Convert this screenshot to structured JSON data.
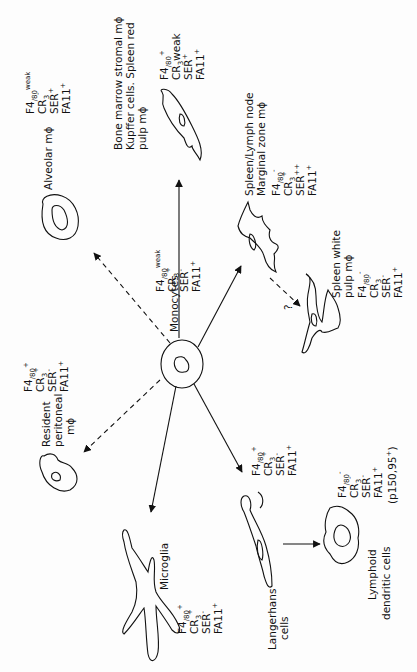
{
  "diagram": {
    "orientation": "rotated 90 degrees counter-clockwise",
    "center_node": {
      "label": "Monocytes",
      "markers": [
        {
          "name": "F4/80",
          "sign": "weak"
        },
        {
          "name": "CR3",
          "sign": "+"
        },
        {
          "name": "SER",
          "sign": "-"
        },
        {
          "name": "FA11",
          "sign": "+"
        }
      ]
    },
    "nodes": [
      {
        "id": "alveolar",
        "label": "Alveolar mϕ",
        "edge": "dashed",
        "markers": [
          {
            "name": "F4/80",
            "sign": "weak"
          },
          {
            "name": "CR3",
            "sign": "-"
          },
          {
            "name": "SER",
            "sign": "+"
          },
          {
            "name": "FA11",
            "sign": "+"
          }
        ]
      },
      {
        "id": "bone-marrow",
        "label_lines": [
          "Bone marrow stromal mϕ",
          "Kupffer cells. Spleen red",
          "pulp mϕ"
        ],
        "edge": "solid",
        "markers": [
          {
            "name": "F4/80",
            "sign": "+"
          },
          {
            "name": "CR3",
            "sign": "weak"
          },
          {
            "name": "SER",
            "sign": "+"
          },
          {
            "name": "FA11",
            "sign": "+"
          }
        ]
      },
      {
        "id": "marginal-zone",
        "label_lines": [
          "Spleen/Lymph node",
          "Marginal zone mϕ"
        ],
        "edge": "solid",
        "markers": [
          {
            "name": "F4/80",
            "sign": "-"
          },
          {
            "name": "CR3",
            "sign": "+"
          },
          {
            "name": "SER",
            "sign": "++"
          },
          {
            "name": "FA11",
            "sign": "+"
          }
        ]
      },
      {
        "id": "white-pulp",
        "label_lines": [
          "Spleen white",
          "pulp mϕ"
        ],
        "edge": "dashed-from-marginal-zone",
        "edge_annotation": "?",
        "markers": [
          {
            "name": "F4/80",
            "sign": "-"
          },
          {
            "name": "CR3",
            "sign": "-"
          },
          {
            "name": "SER",
            "sign": "-"
          },
          {
            "name": "FA11",
            "sign": "+"
          }
        ]
      },
      {
        "id": "peritoneal",
        "label_lines": [
          "Resident",
          "peritoneal",
          "mϕ"
        ],
        "edge": "dashed",
        "markers": [
          {
            "name": "F4/80",
            "sign": "+"
          },
          {
            "name": "CR3",
            "sign": "+"
          },
          {
            "name": "SER",
            "sign": "-"
          },
          {
            "name": "FA11",
            "sign": "+"
          }
        ]
      },
      {
        "id": "microglia",
        "label": "Microglia",
        "edge": "solid",
        "markers": [
          {
            "name": "F4/80",
            "sign": "+"
          },
          {
            "name": "CR3",
            "sign": "+"
          },
          {
            "name": "SER",
            "sign": "-"
          },
          {
            "name": "FA11",
            "sign": "+"
          }
        ]
      },
      {
        "id": "langerhans",
        "label_lines": [
          "Langerhans",
          "cells"
        ],
        "edge": "solid",
        "markers": [
          {
            "name": "F4/80",
            "sign": "+"
          },
          {
            "name": "CR3",
            "sign": "+"
          },
          {
            "name": "SER",
            "sign": "-"
          },
          {
            "name": "FA11",
            "sign": "+"
          }
        ]
      },
      {
        "id": "lymphoid-dc",
        "label_lines": [
          "Lymphoid",
          "dendritic cells"
        ],
        "edge": "solid-from-langerhans",
        "markers": [
          {
            "name": "F4/80",
            "sign": "-"
          },
          {
            "name": "CR3",
            "sign": "-"
          },
          {
            "name": "SER",
            "sign": "-"
          },
          {
            "name": "FA11",
            "sign": "+"
          }
        ],
        "extra_marker": "(p150,95+)"
      }
    ]
  },
  "labels": {
    "monocytes": "Monocytes",
    "alveolar": "Alveolar mϕ",
    "bm1": "Bone marrow stromal mϕ",
    "bm2": "Kupffer cells. Spleen red",
    "bm3": "pulp mϕ",
    "mz1": "Spleen/Lymph node",
    "mz2": "Marginal zone mϕ",
    "wp1": "Spleen white",
    "wp2": "pulp mϕ",
    "wp_q": "?",
    "per1": "Resident",
    "per2": "peritoneal",
    "per3": "mϕ",
    "micro": "Microglia",
    "lang1": "Langerhans",
    "lang2": "cells",
    "ldc1": "Lymphoid",
    "ldc2": "dendritic cells",
    "p150": "(p150,95",
    "p150_sign": "+",
    "p150_close": ")"
  },
  "marker_text": {
    "f480": "F4",
    "f480_sub": "/80",
    "cr3": "CR",
    "cr3_sub": "3",
    "ser": "SER",
    "fa11": "FA11",
    "weak": "weak",
    "plus": "+",
    "minus": "-",
    "plusplus": "++"
  }
}
